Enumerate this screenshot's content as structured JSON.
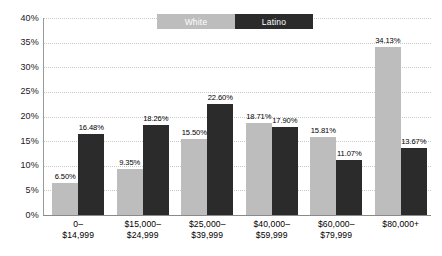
{
  "chart_data": {
    "type": "bar",
    "title": "",
    "xlabel": "",
    "ylabel": "",
    "ylim": [
      0,
      40
    ],
    "ytick_step": 5,
    "grid": true,
    "legend_position": "top-center",
    "categories": [
      "0–\n$14,999",
      "$15,000–\n$24,999",
      "$25,000–\n$39,999",
      "$40,000–\n$59,999",
      "$60,000–\n$79,999",
      "$80,000+"
    ],
    "category_lines": [
      [
        "0–",
        "$14,999"
      ],
      [
        "$15,000–",
        "$24,999"
      ],
      [
        "$25,000–",
        "$39,999"
      ],
      [
        "$40,000–",
        "$59,999"
      ],
      [
        "$60,000–",
        "$79,999"
      ],
      [
        "$80,000+",
        ""
      ]
    ],
    "ytick_labels": [
      "40%",
      "35%",
      "30%",
      "25%",
      "20%",
      "15%",
      "10%",
      "5%",
      "0%"
    ],
    "ytick_values": [
      40,
      35,
      30,
      25,
      20,
      15,
      10,
      5,
      0
    ],
    "series": [
      {
        "name": "White",
        "color": "#bdbdbd",
        "values": [
          6.5,
          9.35,
          15.5,
          18.71,
          15.81,
          34.13
        ],
        "labels": [
          "6.50%",
          "9.35%",
          "15.50%",
          "18.71%",
          "15.81%",
          "34.13%"
        ]
      },
      {
        "name": "Latino",
        "color": "#2b2b2b",
        "values": [
          16.48,
          18.26,
          22.6,
          17.9,
          11.07,
          13.67
        ],
        "labels": [
          "16.48%",
          "18.26%",
          "22.60%",
          "17.90%",
          "11.07%",
          "13.67%"
        ]
      }
    ]
  },
  "legend": {
    "items": [
      {
        "label": "White",
        "color": "#bdbdbd"
      },
      {
        "label": "Latino",
        "color": "#2b2b2b"
      }
    ]
  }
}
